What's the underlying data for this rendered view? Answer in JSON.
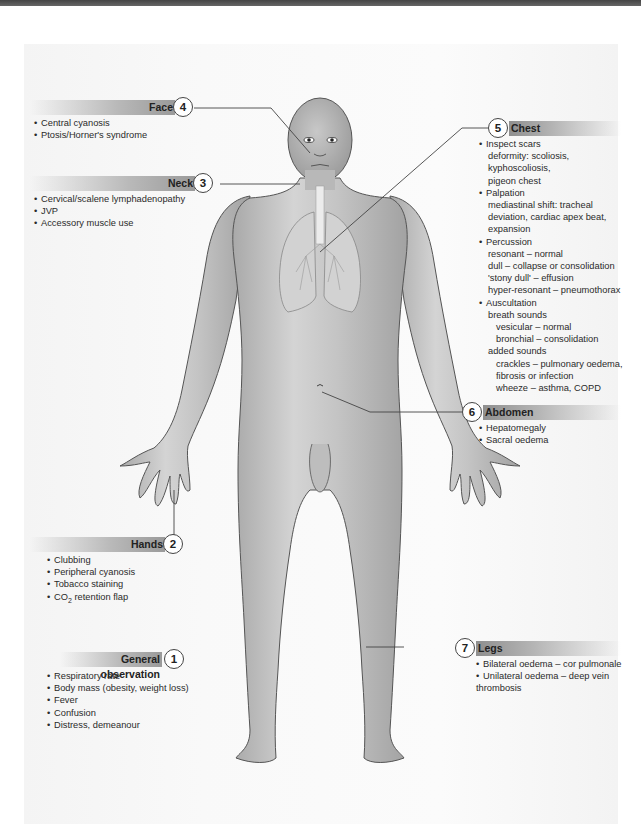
{
  "diagram": {
    "sections": {
      "face": {
        "number": "4",
        "title": "Face",
        "items": [
          "Central cyanosis",
          "Ptosis/Horner's syndrome"
        ]
      },
      "neck": {
        "number": "3",
        "title": "Neck",
        "items": [
          "Cervical/scalene lymphadenopathy",
          "JVP",
          "Accessory muscle use"
        ]
      },
      "chest": {
        "number": "5",
        "title": "Chest",
        "lines": [
          {
            "level": 0,
            "text": "Inspect scars"
          },
          {
            "level": 1,
            "text": "deformity: scoliosis,"
          },
          {
            "level": 1,
            "text": "kyphoscoliosis,"
          },
          {
            "level": 1,
            "text": "pigeon chest"
          },
          {
            "level": 0,
            "text": "Palpation"
          },
          {
            "level": 1,
            "text": "mediastinal shift: tracheal"
          },
          {
            "level": 1,
            "text": "deviation, cardiac apex beat,"
          },
          {
            "level": 1,
            "text": "expansion"
          },
          {
            "level": 0,
            "text": "Percussion"
          },
          {
            "level": 1,
            "text": "resonant – normal"
          },
          {
            "level": 1,
            "text": "dull – collapse or consolidation"
          },
          {
            "level": 1,
            "text": "'stony dull' – effusion"
          },
          {
            "level": 1,
            "text": "hyper-resonant – pneumothorax"
          },
          {
            "level": 0,
            "text": "Auscultation"
          },
          {
            "level": 1,
            "text": "breath sounds"
          },
          {
            "level": 2,
            "text": "vesicular – normal"
          },
          {
            "level": 2,
            "text": "bronchial – consolidation"
          },
          {
            "level": 1,
            "text": "added sounds"
          },
          {
            "level": 2,
            "text": "crackles – pulmonary oedema,"
          },
          {
            "level": 2,
            "text": "fibrosis or infection"
          },
          {
            "level": 2,
            "text": "wheeze – asthma, COPD"
          }
        ]
      },
      "abdomen": {
        "number": "6",
        "title": "Abdomen",
        "items": [
          "Hepatomegaly",
          "Sacral oedema"
        ]
      },
      "hands": {
        "number": "2",
        "title": "Hands",
        "items": [
          "Clubbing",
          "Peripheral cyanosis",
          "Tobacco staining"
        ],
        "co2_item": {
          "prefix": "CO",
          "subscript": "2",
          "suffix": " retention flap"
        }
      },
      "general": {
        "number": "1",
        "title": "General observation",
        "items": [
          "Respiratory rate",
          "Body mass (obesity, weight loss)",
          "Fever",
          "Confusion",
          "Distress, demeanour"
        ]
      },
      "legs": {
        "number": "7",
        "title": "Legs",
        "items": [
          "Bilateral oedema – cor pulmonale",
          "Unilateral oedema – deep vein"
        ],
        "continuation": "thrombosis"
      }
    },
    "bullet": "•",
    "colors": {
      "skin": "#bdbdbd",
      "skin_highlight": "#dcdcdc",
      "outline": "#555555",
      "leader_line": "#444444"
    }
  }
}
